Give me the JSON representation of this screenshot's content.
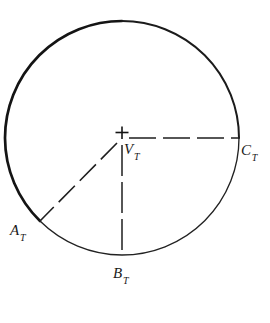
{
  "figure": {
    "type": "geometric-diagram",
    "background_color": "#ffffff",
    "ink_color": "#1a1a1a",
    "canvas": {
      "width": 270,
      "height": 323
    },
    "circle": {
      "center": {
        "x": 122,
        "y": 138
      },
      "radius": 117,
      "stroke_color": "#141414",
      "stroke_width_heavy": 2.6,
      "stroke_width_light": 1.3
    },
    "center_mark": {
      "icon": "plus-cross-icon",
      "x": 122,
      "y": 138,
      "arm_length": 6
    },
    "radii": [
      {
        "name": "radius-to-C",
        "from": {
          "x": 122,
          "y": 138
        },
        "to": {
          "x": 239,
          "y": 138
        },
        "style": "dashed",
        "dash": "26 7"
      },
      {
        "name": "radius-to-B",
        "from": {
          "x": 122,
          "y": 138
        },
        "to": {
          "x": 122,
          "y": 255
        },
        "style": "dashed",
        "dash": "30 6"
      },
      {
        "name": "radius-to-A",
        "from": {
          "x": 122,
          "y": 138
        },
        "to": {
          "x": 40,
          "y": 221
        },
        "style": "dashed",
        "dash": "22 7"
      }
    ],
    "labels": [
      {
        "id": "V",
        "base": "V",
        "subscript": "T",
        "text": "V_T",
        "x": 124,
        "y": 142,
        "anchor": "center-vertex"
      },
      {
        "id": "A",
        "base": "A",
        "subscript": "T",
        "text": "A_T",
        "x": 10,
        "y": 223,
        "anchor": "lower-left-point"
      },
      {
        "id": "B",
        "base": "B",
        "subscript": "T",
        "text": "B_T",
        "x": 113,
        "y": 266,
        "anchor": "bottom-point"
      },
      {
        "id": "C",
        "base": "C",
        "subscript": "T",
        "text": "C_T",
        "x": 241,
        "y": 143,
        "anchor": "right-point"
      }
    ]
  }
}
